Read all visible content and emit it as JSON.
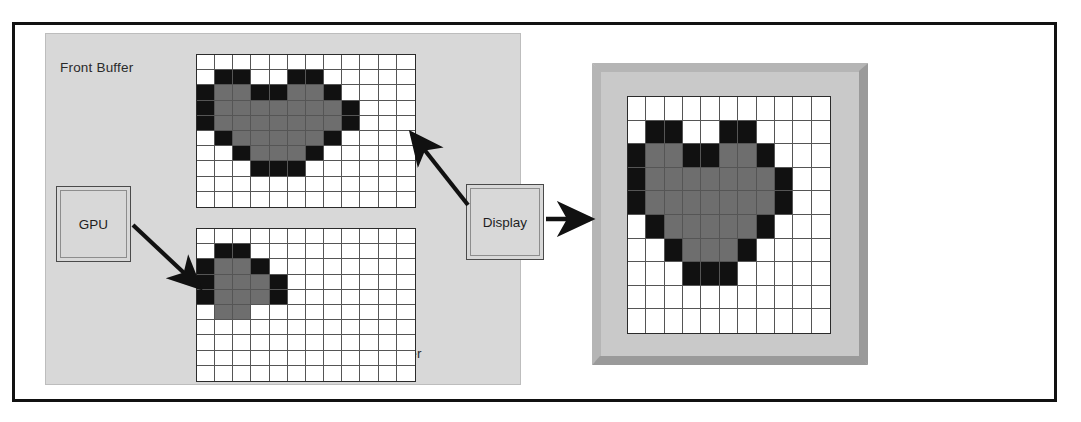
{
  "diagram": {
    "labels": {
      "front_buffer": "Front Buffer",
      "back_buffer": "Back Buffer",
      "gpu": "GPU",
      "display": "Display"
    },
    "colors": {
      "panel_background": "#d8d8d8",
      "frame_border": "#111111",
      "pixel_white": "#ffffff",
      "pixel_gray": "#6e6e6e",
      "pixel_black": "#111111",
      "grid_line": "#555555",
      "monitor_bezel_light": "#b5b5b5",
      "monitor_bezel_dark": "#9a9a9a",
      "monitor_face": "#c9c9c9",
      "arrow": "#111111"
    },
    "arrows": [
      {
        "name": "gpu-to-back-buffer",
        "from": "GPU",
        "to": "Back Buffer",
        "direction": "down-right"
      },
      {
        "name": "front-buffer-to-display",
        "from": "Display",
        "to": "Front Buffer",
        "direction": "up-left"
      },
      {
        "name": "display-to-monitor",
        "from": "Display",
        "to": "Monitor",
        "direction": "right"
      }
    ]
  },
  "chart_data": {
    "type": "heatmap",
    "legend": [
      {
        "key": "w",
        "label": "empty pixel",
        "color": "#ffffff"
      },
      {
        "key": "g",
        "label": "heart fill",
        "color": "#6e6e6e"
      },
      {
        "key": "k",
        "label": "heart outline",
        "color": "#111111"
      }
    ],
    "grids": [
      {
        "name": "front-buffer",
        "label": "Front Buffer",
        "cols": 12,
        "rows": 10,
        "cells": [
          "wwwwwwwwwwww",
          "wkkwwkkwwwww",
          "kggkkggkwwww",
          "kgggggggkwww",
          "kgggggggkwww",
          "wkgggggkwwww",
          "wwkgggkwwwww",
          "wwwkkkwwwwww",
          "wwwwwwwwwwww",
          "wwwwwwwwwwww"
        ]
      },
      {
        "name": "back-buffer",
        "label": "Back Buffer",
        "cols": 12,
        "rows": 10,
        "cells": [
          "wwwwwwwwwwww",
          "wkkwwwwwwwww",
          "kggkwwwwwwww",
          "kgggkwwwwwww",
          "kgggkwwwwwww",
          "wggwwwwwwwww",
          "wwwwwwwwwwww",
          "wwwwwwwwwwww",
          "wwwwwwwwwwww",
          "wwwwwwwwwwww"
        ]
      },
      {
        "name": "monitor-screen",
        "label": "Monitor Screen",
        "cols": 11,
        "rows": 10,
        "cells": [
          "wwwwwwwwwww",
          "wkkwwkkwwww",
          "kggkkggkwww",
          "kgggggggkww",
          "kgggggggkww",
          "wkgggggkwww",
          "wwkgggkwwww",
          "wwwkkkwwwww",
          "wwwwwwwwwww",
          "wwwwwwwwwww"
        ]
      }
    ]
  }
}
